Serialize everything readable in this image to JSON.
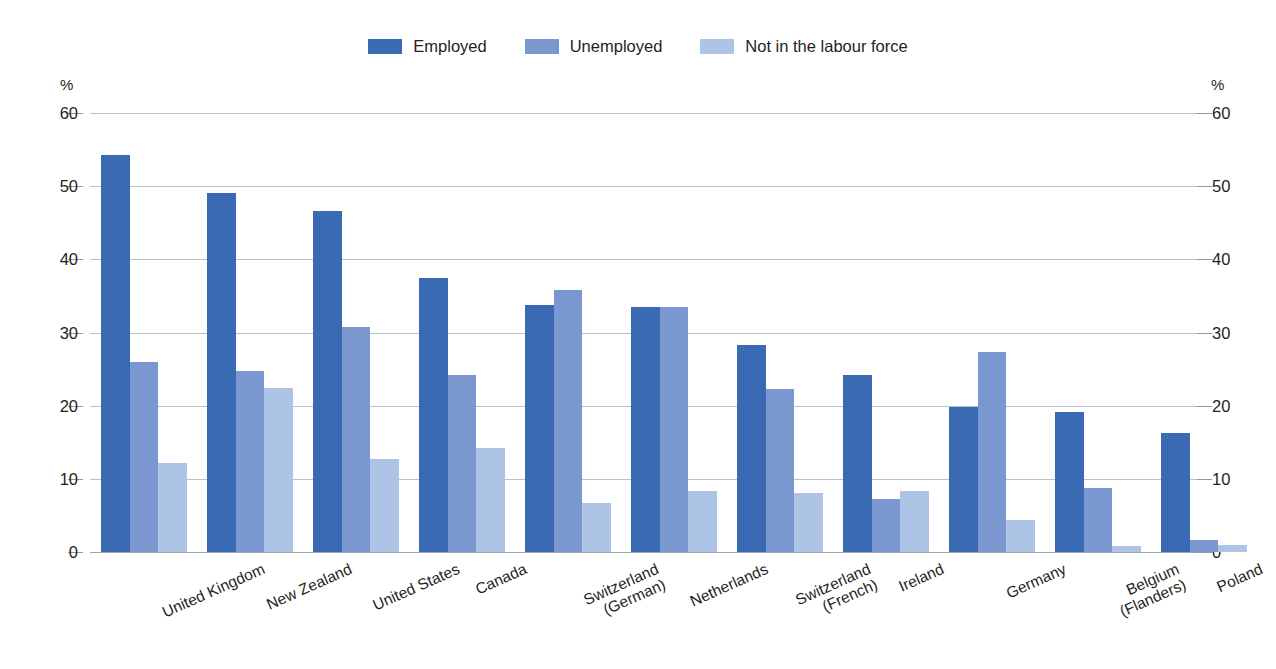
{
  "chart_data": {
    "type": "bar",
    "title": "",
    "subtitle": "",
    "xlabel": "",
    "ylabel": "%",
    "ylabel_right": "%",
    "ylim": [
      0,
      60
    ],
    "yticks": [
      0,
      10,
      20,
      30,
      40,
      50,
      60
    ],
    "ytick_labels": [
      "0",
      "10",
      "20",
      "30",
      "40",
      "50",
      "60"
    ],
    "grid": true,
    "legend_position": "top-center",
    "categories": [
      "United Kingdom",
      "New Zealand",
      "United States",
      "Canada",
      "Switzerland\n(German)",
      "Netherlands",
      "Switzerland\n(French)",
      "Ireland",
      "Germany",
      "Belgium\n(Flanders)",
      "Poland"
    ],
    "series": [
      {
        "name": "Employed",
        "color": "#3a6ab4",
        "values": [
          54.3,
          49.0,
          46.6,
          37.5,
          33.7,
          33.5,
          28.3,
          24.2,
          19.8,
          19.2,
          16.3
        ]
      },
      {
        "name": "Unemployed",
        "color": "#7b97cf",
        "values": [
          26.0,
          24.8,
          30.8,
          24.2,
          35.8,
          33.5,
          22.3,
          7.2,
          27.3,
          8.7,
          1.6
        ]
      },
      {
        "name": "Not in the labour force",
        "color": "#aec4e6",
        "values": [
          12.2,
          22.4,
          12.7,
          14.2,
          6.7,
          8.4,
          8.0,
          8.4,
          4.4,
          0.8,
          1.0
        ]
      }
    ]
  }
}
